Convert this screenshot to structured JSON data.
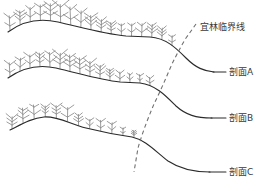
{
  "figure": {
    "title": "",
    "background_color": "#ffffff",
    "width": 262,
    "height": 191,
    "colors": {
      "terrain_line": "#2b2b2b",
      "vegetation": "#8a8a8a",
      "dashed_timberline": "#6f6f6f",
      "text": "#3a3a3a"
    }
  },
  "labels": {
    "timberline": "宜林临界线",
    "profile_a": "剖面A",
    "profile_b": "剖面B",
    "profile_c": "剖面C"
  },
  "diagram_data": {
    "type": "schematic-cross-section",
    "description": "Three stacked terrain cross-section profiles with shrub/tree vegetation symbols; a dashed line marks the timberline (critical forest limit) descending from upper-right to lower-left across the three profiles.",
    "profiles": [
      {
        "id": "A",
        "label": "剖面A",
        "label_position": {
          "x": 218,
          "y": 72
        },
        "vegetation_count": 17,
        "vegetation_extent_x": [
          10,
          172
        ],
        "terrain_path": "M 8,32 C 24,20 40,18 58,22 C 80,27 104,34 126,36 L 150,37 C 166,38 176,48 186,58 C 196,68 204,71 214,72",
        "leader": {
          "x1": 214,
          "y1": 72,
          "x2": 226,
          "y2": 72
        }
      },
      {
        "id": "B",
        "label": "剖面B",
        "label_position": {
          "x": 218,
          "y": 118
        },
        "vegetation_count": 15,
        "vegetation_extent_x": [
          10,
          150
        ],
        "terrain_path": "M 8,78 C 22,68 38,64 56,68 C 78,73 100,80 120,82 L 140,83 C 156,85 166,96 176,106 C 186,115 196,118 212,118",
        "leader": {
          "x1": 212,
          "y1": 118,
          "x2": 226,
          "y2": 118
        }
      },
      {
        "id": "C",
        "label": "剖面C",
        "label_position": {
          "x": 218,
          "y": 172
        },
        "vegetation_count": 12,
        "vegetation_extent_x": [
          12,
          134
        ],
        "terrain_path": "M 10,130 C 22,124 32,118 44,117 C 58,116 70,124 86,128 C 102,132 118,135 132,137 C 146,140 156,152 168,161 C 180,169 192,172 210,172",
        "leader": {
          "x1": 210,
          "y1": 172,
          "x2": 226,
          "y2": 172
        }
      }
    ],
    "timberline": {
      "label": "宜林临界线",
      "label_position": {
        "x": 200,
        "y": 27
      },
      "style": "dashed",
      "path": "M 196,24 L 186,38 C 180,48 176,56 172,64 C 166,78 160,92 154,104 C 148,118 142,134 138,148 L 134,172",
      "crosses_profiles_at": [
        {
          "profile": "A",
          "x": 176,
          "y": 47
        },
        {
          "profile": "B",
          "x": 152,
          "y": 90
        },
        {
          "profile": "C",
          "x": 136,
          "y": 140
        }
      ]
    }
  }
}
